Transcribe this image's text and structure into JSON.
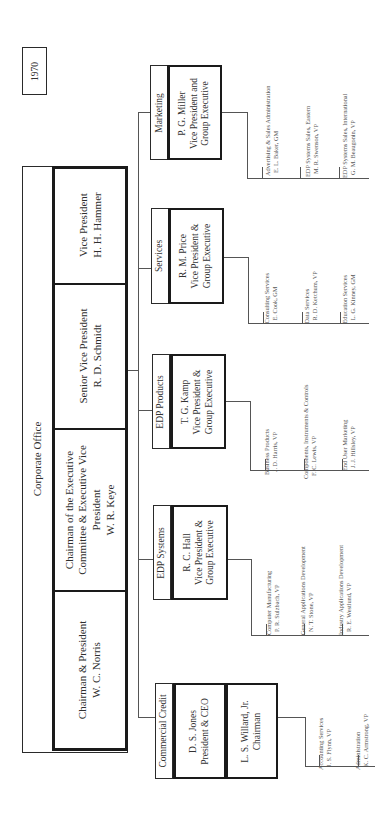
{
  "year": "1970",
  "corporate_office": {
    "title": "Corporate Office",
    "members": [
      {
        "title": "Chairman & President",
        "name": "W. C. Norris"
      },
      {
        "title": "Chairman of the Executive Committee & Executive Vice President",
        "title_lines": [
          "Chairman of the Executive",
          "Committee & Executive Vice",
          "President"
        ],
        "name": "W. R. Keye"
      },
      {
        "title": "Senior Vice President",
        "name": "R. D. Schmidt"
      },
      {
        "title": "Vice President",
        "name": "H. H. Hammer"
      }
    ]
  },
  "groups": [
    {
      "label": "Marketing",
      "head_name": "P. G. Miller",
      "head_title_lines": [
        "Vice President and",
        "Group Executive"
      ],
      "units": [
        {
          "unit": "Advertising & Sales Administration",
          "person": "E. L. Baker, GM"
        },
        {
          "unit": "EDP Systems Sales, Eastern",
          "person": "M. R. Swenson, VP"
        },
        {
          "unit": "EDP Systems Sales, International",
          "person": "G. M. Beaugonin, VP"
        }
      ]
    },
    {
      "label": "Services",
      "head_name": "R. M. Price",
      "head_title_lines": [
        "Vice President &",
        "Group Executive"
      ],
      "units": [
        {
          "unit": "Consulting Services",
          "person": "E. Cook, GM"
        },
        {
          "unit": "Data Services",
          "person": "R. D. Ketchum, VP"
        },
        {
          "unit": "Education Services",
          "person": "L. G. Kinney, GM"
        }
      ]
    },
    {
      "label": "EDP Products",
      "head_name": "T. G. Kamp",
      "head_title_lines": [
        "Vice President &",
        "Group Executive"
      ],
      "units": [
        {
          "unit": "Business Products",
          "person": "J. D. Harris, VP"
        },
        {
          "unit": "Components, Instruments & Controls",
          "person": "F. C. Lewis, VP"
        },
        {
          "unit": "End User Marketing",
          "person": "J. J. Hillsley, VP"
        }
      ]
    },
    {
      "label": "EDP Systems",
      "head_name": "R. C. Hall",
      "head_title_lines": [
        "Vice President &",
        "Group Executive"
      ],
      "units": [
        {
          "unit": "Computer Manufacturing",
          "person": "P. R. Sulzbach, VP"
        },
        {
          "unit": "General Applications Development",
          "person": "N. T. Stone, VP"
        },
        {
          "unit": "Industry Applications Development",
          "person": "R. E. Westlund, VP"
        }
      ]
    },
    {
      "label": "Commercial Credit",
      "head_name": "D. S. Jones",
      "head_title_lines": [
        "President & CEO"
      ],
      "second_name": "L. S. Willard, Jr.",
      "second_title": "Chairman",
      "units": [
        {
          "unit": "Accounting Services",
          "person": "J. S. Flynn, VP"
        },
        {
          "unit": "Administration",
          "person": "K. C. Armstrong, VP"
        }
      ]
    }
  ]
}
